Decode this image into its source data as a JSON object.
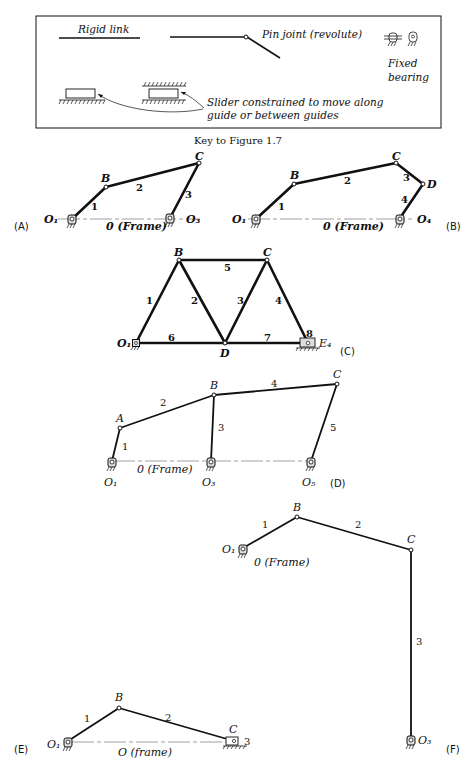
{
  "key": {
    "rigid_link_label": "Rigid link",
    "pin_joint_label": "Pin joint (revolute)",
    "fixed_bearing_label_line1": "Fixed",
    "fixed_bearing_label_line2": "bearing",
    "slider_label_line1": "Slider constrained to move along",
    "slider_label_line2": "guide or between guides",
    "caption": "Key to Figure 1.7"
  },
  "figures": {
    "A": {
      "tag": "(A)",
      "points": {
        "O1": "O₁",
        "B": "B",
        "C": "C",
        "O3": "O₃"
      },
      "links": [
        "1",
        "2",
        "3"
      ],
      "frame": "0 (Frame)"
    },
    "B": {
      "tag": "(B)",
      "points": {
        "O1": "O₁",
        "B": "B",
        "C": "C",
        "D": "D",
        "O4": "O₄"
      },
      "links": [
        "1",
        "2",
        "3",
        "4"
      ],
      "frame": "0 (Frame)"
    },
    "C": {
      "tag": "(C)",
      "points": {
        "O1": "O₁",
        "B": "B",
        "C": "C",
        "D": "D",
        "E4": "E₄"
      },
      "links": [
        "1",
        "2",
        "3",
        "4",
        "5",
        "6",
        "7",
        "8"
      ]
    },
    "D": {
      "tag": "(D)",
      "points": {
        "A": "A",
        "B": "B",
        "C": "C",
        "O1": "O₁",
        "O3": "O₃",
        "O5": "O₅"
      },
      "links": [
        "1",
        "2",
        "3",
        "4",
        "5"
      ],
      "frame": "0 (Frame)"
    },
    "F": {
      "tag": "(F)",
      "points": {
        "O1": "O₁",
        "B": "B",
        "C": "C",
        "O3": "O₃"
      },
      "links": [
        "1",
        "2",
        "3"
      ],
      "frame": "0 (Frame)"
    },
    "E": {
      "tag": "(E)",
      "points": {
        "O1": "O₁",
        "B": "B",
        "C": "C"
      },
      "links": [
        "1",
        "2",
        "3"
      ],
      "frame": "O (frame)"
    }
  }
}
